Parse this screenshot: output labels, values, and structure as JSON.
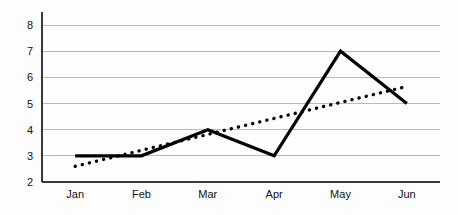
{
  "chart_data": {
    "type": "line",
    "title": "",
    "subtitle": "",
    "xlabel": "",
    "ylabel": "",
    "categories": [
      "Jan",
      "Feb",
      "Mar",
      "Apr",
      "May",
      "Jun"
    ],
    "series": [
      {
        "name": "series-1",
        "style": "solid",
        "color": "#000000",
        "values": [
          3,
          3,
          4,
          3,
          7,
          5
        ]
      },
      {
        "name": "trendline",
        "style": "dotted",
        "color": "#000000",
        "values": [
          2.6,
          3.21,
          3.82,
          4.43,
          5.04,
          5.65
        ]
      }
    ],
    "ylim": [
      2,
      8
    ],
    "y_ticks": [
      2,
      3,
      4,
      5,
      6,
      7,
      8
    ],
    "grid": true,
    "legend": false,
    "legend_position": "none"
  },
  "axes": {
    "y_tick_labels": [
      "2",
      "3",
      "4",
      "5",
      "6",
      "7",
      "8"
    ],
    "x_tick_labels": [
      "Jan",
      "Feb",
      "Mar",
      "Apr",
      "May",
      "Jun"
    ]
  },
  "colors": {
    "background": "#fdfdfd",
    "gridline": "#b9b9b9",
    "axis": "#3a3a3a",
    "series": "#000000",
    "text": "#111111"
  }
}
